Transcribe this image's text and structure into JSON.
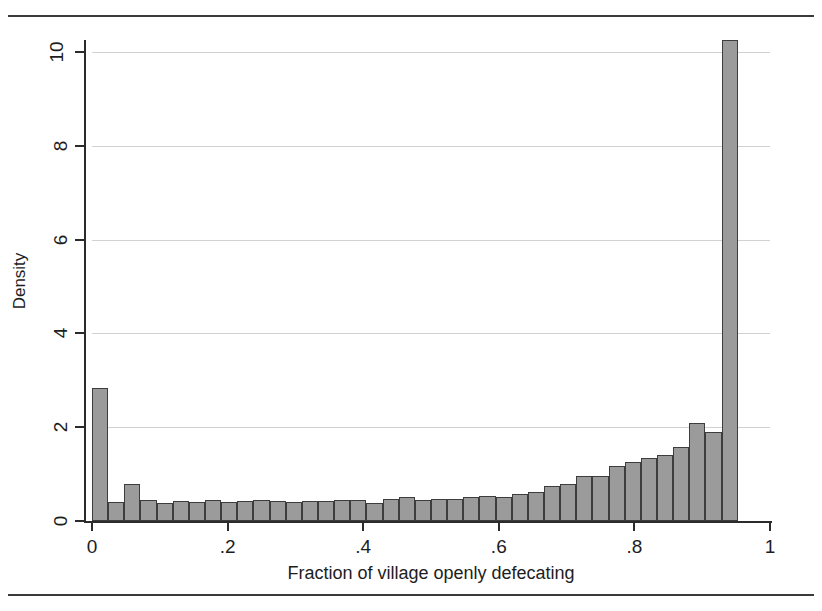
{
  "figure": {
    "clipped_header_text": "",
    "background": "#ffffff",
    "bar_fill": "#9b9b9b",
    "bar_outline": "#3d3d3d",
    "grid_color": "#d2d2d2",
    "axis_color": "#2b2b2b"
  },
  "chart_data": {
    "type": "bar",
    "title": "",
    "subtitle": "",
    "xlabel": "Fraction of village openly defecating",
    "ylabel": "Density",
    "xlim": [
      0,
      1
    ],
    "ylim": [
      0,
      10.6
    ],
    "xticks": [
      0,
      0.2,
      0.4,
      0.6,
      0.8,
      1
    ],
    "xtick_labels": [
      "0",
      ".2",
      ".4",
      ".6",
      ".8",
      "1"
    ],
    "yticks": [
      0,
      2,
      4,
      6,
      8,
      10
    ],
    "ytick_labels": [
      "0",
      "2",
      "4",
      "6",
      "8",
      "10"
    ],
    "grid": "horizontal",
    "legend": "none",
    "bin_width": 0.0238,
    "bin_count": 42,
    "categories": [
      "0.000",
      "0.024",
      "0.048",
      "0.071",
      "0.095",
      "0.119",
      "0.143",
      "0.167",
      "0.190",
      "0.214",
      "0.238",
      "0.262",
      "0.286",
      "0.310",
      "0.333",
      "0.357",
      "0.381",
      "0.405",
      "0.429",
      "0.452",
      "0.476",
      "0.500",
      "0.524",
      "0.548",
      "0.571",
      "0.595",
      "0.619",
      "0.643",
      "0.667",
      "0.690",
      "0.714",
      "0.738",
      "0.762",
      "0.786",
      "0.810",
      "0.833",
      "0.857",
      "0.881",
      "0.905",
      "0.929",
      "0.952",
      "0.976"
    ],
    "values": [
      2.84,
      0.4,
      0.78,
      0.44,
      0.38,
      0.42,
      0.4,
      0.44,
      0.4,
      0.42,
      0.44,
      0.42,
      0.4,
      0.42,
      0.42,
      0.44,
      0.44,
      0.38,
      0.48,
      0.52,
      0.44,
      0.46,
      0.48,
      0.52,
      0.54,
      0.52,
      0.58,
      0.62,
      0.74,
      0.78,
      0.96,
      0.96,
      1.18,
      1.26,
      1.34,
      1.4,
      1.58,
      2.1,
      1.9,
      10.25,
      0.0,
      0.0
    ]
  }
}
